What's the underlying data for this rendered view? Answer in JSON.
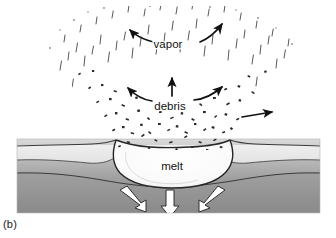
{
  "figure": {
    "caption": "(b)",
    "stage_description": "Excavation stage of hypervelocity impact showing upward expanding vapor plume, outward ballistic debris ejecta, a bowl-shaped melt-lined transient cavity with raised rims, and downward propagating shock front in the target stratigraphy."
  },
  "labels": {
    "vapor": "vapor",
    "debris": "debris",
    "melt": "melt"
  },
  "label_positions": {
    "vapor": {
      "x": 168,
      "y": 48
    },
    "debris": {
      "x": 168,
      "y": 108
    },
    "melt": {
      "x": 172,
      "y": 168
    }
  },
  "colors": {
    "background": "#ffffff",
    "ink": "#111111",
    "layer_top": "#e9e9e9",
    "layer_middle_light": "#d2d2d2",
    "layer_middle_dark": "#9a9a9a",
    "layer_bottom_light": "#a8a8a8",
    "layer_bottom_dark": "#8c8c8c",
    "melt_fill": "#fbfbfb",
    "shock_arrow_fill": "#ffffff",
    "shock_arrow_stroke": "#2b2b2b",
    "ejecta_particle": "#2a2a2a",
    "vapor_streak": "#5a5a5a"
  },
  "ground_block": {
    "x": 17,
    "y": 139,
    "width": 303,
    "height": 74,
    "layers": [
      {
        "name": "surface-regolith-layer",
        "label": "upper light layer"
      },
      {
        "name": "middle-bedrock-layer",
        "label": "middle graded layer"
      },
      {
        "name": "lower-basement-layer",
        "label": "lower graded layer"
      }
    ]
  },
  "crater": {
    "name": "transient-melt-cavity",
    "rim_left_x": 113,
    "rim_right_x": 232,
    "floor_y": 182,
    "rim_y": 140
  },
  "arrows": {
    "vapor_left": {
      "name": "vapor-arrow-left",
      "direction": "up-left",
      "style": "curved"
    },
    "vapor_right": {
      "name": "vapor-arrow-right",
      "direction": "up-right",
      "style": "curved"
    },
    "debris_left": {
      "name": "debris-arrow-left",
      "direction": "up-left",
      "style": "curved"
    },
    "debris_center": {
      "name": "debris-arrow-center",
      "direction": "up",
      "style": "straight"
    },
    "debris_right": {
      "name": "debris-arrow-right",
      "direction": "up-right",
      "style": "curved"
    },
    "ejecta_right_low": {
      "name": "ejecta-arrow-right-lower",
      "direction": "right",
      "style": "straight"
    },
    "shock_left": {
      "name": "shock-arrow-left",
      "direction": "down-left",
      "style": "block-outline"
    },
    "shock_center": {
      "name": "shock-arrow-center",
      "direction": "down",
      "style": "block-outline"
    },
    "shock_right": {
      "name": "shock-arrow-right",
      "direction": "down-right",
      "style": "block-outline"
    }
  },
  "plume": {
    "name": "ejecta-plume",
    "apex_y": 4,
    "base_y": 150,
    "spread_left_x": 22,
    "spread_right_x": 314,
    "zones": [
      {
        "name": "vapor-zone",
        "description": "fine vertical streaks, sparse"
      },
      {
        "name": "debris-zone",
        "description": "dense dark angular particles"
      }
    ]
  }
}
